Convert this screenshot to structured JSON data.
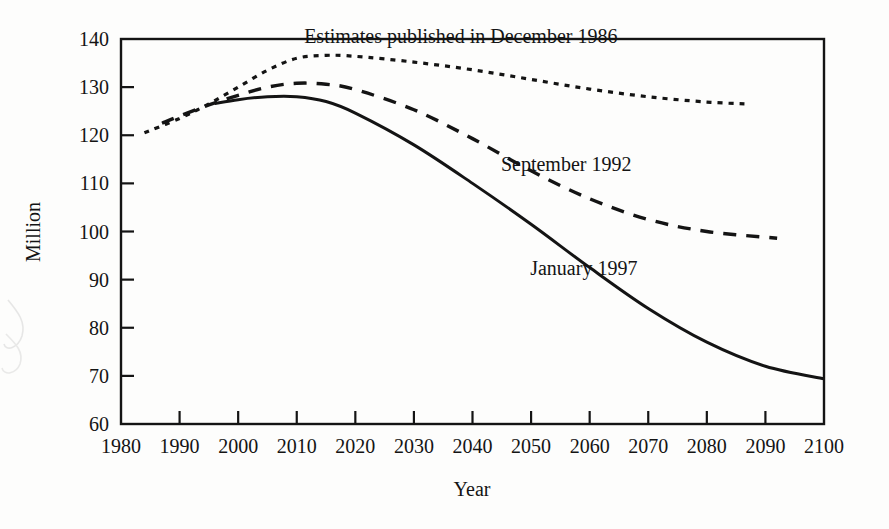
{
  "chart_data": {
    "type": "line",
    "title": "",
    "xlabel": "Year",
    "ylabel": "Million",
    "xlim": [
      1980,
      2100
    ],
    "ylim": [
      60,
      140
    ],
    "xticks": [
      1980,
      1990,
      2000,
      2010,
      2020,
      2030,
      2040,
      2050,
      2060,
      2070,
      2080,
      2090,
      2100
    ],
    "yticks": [
      60,
      70,
      80,
      90,
      100,
      110,
      120,
      130,
      140
    ],
    "grid": false,
    "legend_position": "inline-annotations",
    "series": [
      {
        "name": "Estimates published in December 1986",
        "style": "dotted",
        "x": [
          1984,
          1990,
          1995,
          2000,
          2005,
          2010,
          2015,
          2020,
          2030,
          2040,
          2050,
          2060,
          2070,
          2080,
          2087
        ],
        "values": [
          120.5,
          123.5,
          126.5,
          130.0,
          133.5,
          136.0,
          136.6,
          136.4,
          135.2,
          133.6,
          131.6,
          129.6,
          128.0,
          126.9,
          126.5
        ]
      },
      {
        "name": "September 1992",
        "style": "dashed",
        "x": [
          1987,
          1990,
          1995,
          2000,
          2005,
          2010,
          2015,
          2020,
          2030,
          2040,
          2050,
          2060,
          2070,
          2080,
          2092
        ],
        "values": [
          122.5,
          124.0,
          126.3,
          128.3,
          130.0,
          130.8,
          130.6,
          129.5,
          125.3,
          119.3,
          112.6,
          106.8,
          102.5,
          100.0,
          98.6
        ]
      },
      {
        "name": "January 1997",
        "style": "solid",
        "x": [
          1996,
          2000,
          2005,
          2010,
          2015,
          2020,
          2030,
          2040,
          2050,
          2060,
          2070,
          2080,
          2090,
          2100
        ],
        "values": [
          126.6,
          127.4,
          128.0,
          128.0,
          127.0,
          124.6,
          118.0,
          110.0,
          101.5,
          92.5,
          84.0,
          77.0,
          72.0,
          69.4
        ]
      }
    ],
    "annotations": [
      {
        "text": "Estimates published in December 1986",
        "x": 2038,
        "y": 139.2
      },
      {
        "text": "September 1992",
        "x": 2056,
        "y": 112.5
      },
      {
        "text": "January 1997",
        "x": 2059,
        "y": 91.0
      }
    ]
  },
  "axis": {
    "y_label": "Million",
    "x_label": "Year",
    "y_ticks": [
      "140",
      "130",
      "120",
      "110",
      "100",
      "90",
      "80",
      "70",
      "60"
    ],
    "x_ticks": [
      "1980",
      "1990",
      "2000",
      "2010",
      "2020",
      "2030",
      "2040",
      "2050",
      "2060",
      "2070",
      "2080",
      "2090",
      "2100"
    ]
  },
  "annotations": {
    "dotted": "Estimates published in December 1986",
    "dashed": "September 1992",
    "solid": "January 1997"
  },
  "colors": {
    "ink": "#141414",
    "page": "#fdfdfc"
  }
}
